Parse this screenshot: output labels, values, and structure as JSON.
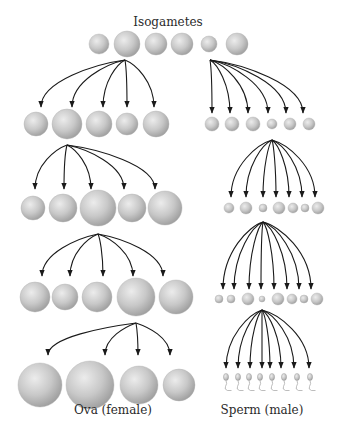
{
  "title": "Isogametes",
  "labels": {
    "female": "Ova (female)",
    "male": "Sperm (male)"
  },
  "colors": {
    "sphere_light": "#ececec",
    "sphere_mid": "#c8c8c8",
    "sphere_dark": "#9c9c9c",
    "arrow": "#1a1a1a",
    "text": "#2a2a2a"
  },
  "isogametes": [
    {
      "x": 99,
      "y": 44,
      "r": 10
    },
    {
      "x": 127,
      "y": 44,
      "r": 13
    },
    {
      "x": 156,
      "y": 44,
      "r": 11
    },
    {
      "x": 182,
      "y": 44,
      "r": 11
    },
    {
      "x": 209,
      "y": 44,
      "r": 8
    },
    {
      "x": 237,
      "y": 44,
      "r": 11
    }
  ],
  "female_lineage": [
    {
      "origin": [
        125,
        60
      ],
      "tips": [
        [
          41,
          107
        ],
        [
          72,
          107
        ],
        [
          103,
          107
        ],
        [
          127,
          107
        ],
        [
          154,
          107
        ]
      ],
      "cells": [
        {
          "x": 36,
          "y": 124,
          "r": 12
        },
        {
          "x": 67,
          "y": 124,
          "r": 15
        },
        {
          "x": 99,
          "y": 124,
          "r": 13
        },
        {
          "x": 127,
          "y": 124,
          "r": 11
        },
        {
          "x": 156,
          "y": 124,
          "r": 13
        }
      ]
    },
    {
      "origin": [
        67,
        145
      ],
      "tips": [
        [
          35,
          189
        ],
        [
          64,
          189
        ],
        [
          91,
          189
        ],
        [
          124,
          189
        ],
        [
          155,
          189
        ]
      ],
      "cells": [
        {
          "x": 33,
          "y": 208,
          "r": 12
        },
        {
          "x": 63,
          "y": 208,
          "r": 14
        },
        {
          "x": 98,
          "y": 208,
          "r": 18
        },
        {
          "x": 132,
          "y": 208,
          "r": 14
        },
        {
          "x": 165,
          "y": 208,
          "r": 17
        }
      ]
    },
    {
      "origin": [
        98,
        234
      ],
      "tips": [
        [
          42,
          276
        ],
        [
          70,
          276
        ],
        [
          103,
          276
        ],
        [
          133,
          276
        ],
        [
          163,
          276
        ]
      ],
      "cells": [
        {
          "x": 35,
          "y": 297,
          "r": 15
        },
        {
          "x": 65,
          "y": 297,
          "r": 13
        },
        {
          "x": 97,
          "y": 297,
          "r": 15
        },
        {
          "x": 136,
          "y": 297,
          "r": 19
        },
        {
          "x": 176,
          "y": 297,
          "r": 17
        }
      ]
    },
    {
      "origin": [
        136,
        323
      ],
      "tips": [
        [
          48,
          355
        ],
        [
          105,
          355
        ],
        [
          138,
          355
        ],
        [
          170,
          355
        ]
      ],
      "cells": [
        {
          "x": 40,
          "y": 385,
          "r": 22
        },
        {
          "x": 90,
          "y": 385,
          "r": 24
        },
        {
          "x": 139,
          "y": 385,
          "r": 19
        },
        {
          "x": 179,
          "y": 385,
          "r": 16
        }
      ]
    }
  ],
  "male_lineage": [
    {
      "origin": [
        210,
        60
      ],
      "tips": [
        [
          212,
          113
        ],
        [
          230,
          113
        ],
        [
          248,
          113
        ],
        [
          268,
          113
        ],
        [
          286,
          113
        ],
        [
          303,
          113
        ]
      ],
      "cells": [
        {
          "x": 212,
          "y": 124,
          "r": 7
        },
        {
          "x": 232,
          "y": 124,
          "r": 7
        },
        {
          "x": 253,
          "y": 124,
          "r": 7
        },
        {
          "x": 272,
          "y": 124,
          "r": 5
        },
        {
          "x": 290,
          "y": 124,
          "r": 6
        },
        {
          "x": 309,
          "y": 124,
          "r": 6
        }
      ]
    },
    {
      "origin": [
        272,
        140
      ],
      "tips": [
        [
          231,
          197
        ],
        [
          246,
          197
        ],
        [
          263,
          197
        ],
        [
          276,
          197
        ],
        [
          289,
          197
        ],
        [
          302,
          197
        ],
        [
          315,
          197
        ]
      ],
      "cells": [
        {
          "x": 229,
          "y": 208,
          "r": 5
        },
        {
          "x": 246,
          "y": 208,
          "r": 6
        },
        {
          "x": 263,
          "y": 208,
          "r": 4
        },
        {
          "x": 279,
          "y": 208,
          "r": 6
        },
        {
          "x": 293,
          "y": 208,
          "r": 5
        },
        {
          "x": 305,
          "y": 208,
          "r": 4
        },
        {
          "x": 318,
          "y": 208,
          "r": 6
        }
      ]
    },
    {
      "origin": [
        263,
        222
      ],
      "tips": [
        [
          223,
          289
        ],
        [
          234,
          289
        ],
        [
          249,
          289
        ],
        [
          261,
          289
        ],
        [
          274,
          289
        ],
        [
          287,
          289
        ],
        [
          299,
          289
        ],
        [
          311,
          289
        ]
      ],
      "cells": [
        {
          "x": 219,
          "y": 299,
          "r": 4
        },
        {
          "x": 231,
          "y": 299,
          "r": 4
        },
        {
          "x": 248,
          "y": 299,
          "r": 6
        },
        {
          "x": 262,
          "y": 299,
          "r": 3
        },
        {
          "x": 278,
          "y": 299,
          "r": 6
        },
        {
          "x": 292,
          "y": 299,
          "r": 5
        },
        {
          "x": 304,
          "y": 299,
          "r": 4
        },
        {
          "x": 317,
          "y": 299,
          "r": 6
        }
      ]
    },
    {
      "origin": [
        262,
        310
      ],
      "tips": [
        [
          226,
          368
        ],
        [
          238,
          368
        ],
        [
          250,
          368
        ],
        [
          262,
          368
        ],
        [
          270,
          368
        ],
        [
          281,
          368
        ],
        [
          294,
          368
        ],
        [
          309,
          368
        ]
      ],
      "sperm": [
        {
          "x": 226,
          "y": 377
        },
        {
          "x": 238,
          "y": 377
        },
        {
          "x": 249,
          "y": 377
        },
        {
          "x": 260,
          "y": 377
        },
        {
          "x": 272,
          "y": 377
        },
        {
          "x": 284,
          "y": 377
        },
        {
          "x": 297,
          "y": 377
        },
        {
          "x": 310,
          "y": 377
        }
      ]
    }
  ]
}
